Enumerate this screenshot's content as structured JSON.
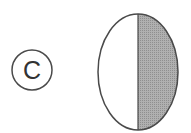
{
  "diagram": {
    "label": "C",
    "figure": "ellipse-right-half-shaded",
    "colors": {
      "stroke": "#4a4a4a",
      "shade": "#a8a8a8",
      "background": "#ffffff"
    }
  }
}
